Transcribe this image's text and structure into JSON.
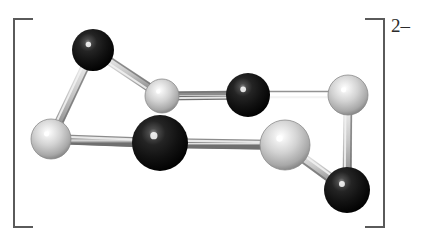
{
  "figure": {
    "width": 427,
    "height": 234,
    "background": "#ffffff",
    "caption_charge": "2–",
    "bracket_color": "#5a5a5a"
  },
  "brackets": {
    "left": {
      "x": 13,
      "y": 18,
      "width": 20,
      "height": 210
    },
    "right": {
      "x": 365,
      "y": 18,
      "width": 20,
      "height": 210
    }
  },
  "charge": {
    "text": "2–",
    "x": 391,
    "y": 16
  },
  "molecule": {
    "name": "ball-and-stick-anion",
    "style": "ball-and-stick",
    "overall_charge": "2-",
    "atom_types": [
      {
        "key": "dark",
        "label": "dark-atom",
        "base_color": "#141414",
        "highlight_color": "#9a9a9a",
        "shadow_color": "#000000"
      },
      {
        "key": "light",
        "label": "light-atom",
        "base_color": "#c8c8c8",
        "highlight_color": "#ffffff",
        "shadow_color": "#6e6e6e"
      }
    ],
    "bond_color": "#b8b8b8",
    "bond_edge_color": "#7d7d7d",
    "atoms": [
      {
        "id": "a1",
        "name": "dark-atom-top-left",
        "type": "dark",
        "cx": 93,
        "cy": 50,
        "r": 21
      },
      {
        "id": "a2",
        "name": "light-atom-left",
        "type": "light",
        "cx": 51,
        "cy": 139,
        "r": 20
      },
      {
        "id": "a3",
        "name": "light-atom-top-mid",
        "type": "light",
        "cx": 162,
        "cy": 96,
        "r": 17
      },
      {
        "id": "a4",
        "name": "dark-atom-top-mid",
        "type": "dark",
        "cx": 248,
        "cy": 95,
        "r": 22
      },
      {
        "id": "a5",
        "name": "light-atom-top-right",
        "type": "light",
        "cx": 348,
        "cy": 95,
        "r": 20
      },
      {
        "id": "a6",
        "name": "dark-atom-center",
        "type": "dark",
        "cx": 160,
        "cy": 143,
        "r": 28
      },
      {
        "id": "a7",
        "name": "light-atom-bottom-right",
        "type": "light",
        "cx": 285,
        "cy": 145,
        "r": 25
      },
      {
        "id": "a8",
        "name": "dark-atom-bottom-right",
        "type": "dark",
        "cx": 347,
        "cy": 190,
        "r": 23
      }
    ],
    "bonds": [
      {
        "id": "b1",
        "name": "bond-dark-top-left-to-light-left",
        "from": "a1",
        "to": "a2",
        "width": 9
      },
      {
        "id": "b2",
        "name": "bond-dark-top-left-to-light-top-mid",
        "from": "a1",
        "to": "a3",
        "width": 9
      },
      {
        "id": "b3",
        "name": "bond-light-top-mid-to-dark-top-mid",
        "from": "a3",
        "to": "a4",
        "width": 9
      },
      {
        "id": "b4",
        "name": "bond-dark-top-mid-to-light-top-right",
        "from": "a4",
        "to": "a5",
        "width": 9
      },
      {
        "id": "b5",
        "name": "bond-light-top-right-to-dark-bottom-right",
        "from": "a5",
        "to": "a8",
        "width": 9
      },
      {
        "id": "b6",
        "name": "bond-dark-bottom-right-to-light-bot-right",
        "from": "a8",
        "to": "a7",
        "width": 10
      },
      {
        "id": "b7",
        "name": "bond-light-bot-right-to-dark-center",
        "from": "a7",
        "to": "a6",
        "width": 10
      },
      {
        "id": "b8",
        "name": "bond-dark-center-to-light-left",
        "from": "a6",
        "to": "a2",
        "width": 10
      }
    ]
  }
}
